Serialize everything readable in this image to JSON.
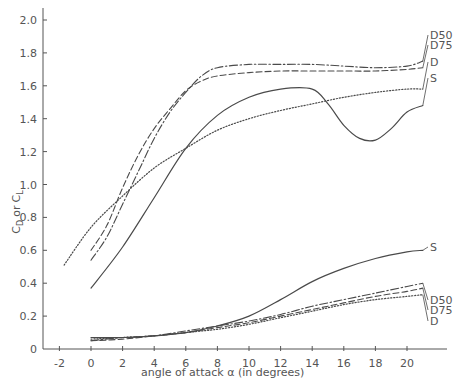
{
  "chart_data": {
    "type": "line",
    "title": "",
    "xlabel": "angle of attack  α (in degrees)",
    "ylabel": "C_D or C_L",
    "xlim": [
      -2.8,
      22.5
    ],
    "ylim": [
      0,
      2.1
    ],
    "grid": false,
    "legend": "inline labels at right end of each curve",
    "x_ticks": [
      -2,
      0,
      2,
      4,
      6,
      8,
      10,
      12,
      14,
      16,
      18,
      20
    ],
    "x_tick_labels": [
      "-2",
      "0",
      "2",
      "4",
      "6",
      "8",
      "10",
      "12",
      "14",
      "16",
      "18",
      "20"
    ],
    "y_ticks": [
      0,
      0.2,
      0.4,
      0.6,
      0.8,
      1.0,
      1.2,
      1.4,
      1.6,
      1.8,
      2.0
    ],
    "y_tick_labels": [
      "0",
      "0.2",
      "0.4",
      "0.6",
      "0.8",
      "1.0",
      "1.2",
      "1.4",
      "1.6",
      "1.8",
      "2.0"
    ],
    "series": [
      {
        "name": "D50",
        "group": "lift",
        "style": "dash-dot",
        "x": [
          0,
          1,
          2,
          3,
          4,
          5,
          6,
          7,
          8,
          10,
          12,
          14,
          16,
          18,
          20,
          21
        ],
        "values": [
          0.54,
          0.68,
          0.88,
          1.08,
          1.28,
          1.44,
          1.56,
          1.66,
          1.71,
          1.73,
          1.73,
          1.73,
          1.72,
          1.71,
          1.72,
          1.75
        ]
      },
      {
        "name": "D75",
        "group": "lift",
        "style": "dashed",
        "x": [
          0,
          1,
          2,
          3,
          4,
          5,
          6,
          7,
          8,
          10,
          12,
          14,
          16,
          18,
          20,
          21
        ],
        "values": [
          0.6,
          0.75,
          0.98,
          1.18,
          1.34,
          1.46,
          1.57,
          1.63,
          1.66,
          1.68,
          1.69,
          1.69,
          1.69,
          1.69,
          1.7,
          1.71
        ]
      },
      {
        "name": "D",
        "group": "lift",
        "style": "dotted",
        "x": [
          -1.7,
          0,
          2,
          4,
          6,
          8,
          10,
          12,
          14,
          16,
          18,
          20,
          21
        ],
        "values": [
          0.51,
          0.74,
          0.93,
          1.1,
          1.22,
          1.33,
          1.4,
          1.45,
          1.49,
          1.53,
          1.56,
          1.58,
          1.58
        ]
      },
      {
        "name": "S",
        "group": "lift",
        "style": "solid",
        "x": [
          0,
          2,
          4,
          6,
          8,
          10,
          12,
          14,
          15,
          16,
          17,
          18,
          19,
          20,
          21
        ],
        "values": [
          0.37,
          0.62,
          0.92,
          1.22,
          1.42,
          1.53,
          1.58,
          1.58,
          1.49,
          1.36,
          1.28,
          1.27,
          1.34,
          1.44,
          1.48
        ]
      },
      {
        "name": "S",
        "group": "drag",
        "style": "solid",
        "x": [
          0,
          2,
          4,
          6,
          8,
          10,
          12,
          14,
          16,
          18,
          20,
          21
        ],
        "values": [
          0.07,
          0.07,
          0.08,
          0.1,
          0.14,
          0.2,
          0.3,
          0.41,
          0.49,
          0.55,
          0.59,
          0.6
        ]
      },
      {
        "name": "D50",
        "group": "drag",
        "style": "dash-dot",
        "x": [
          0,
          2,
          4,
          6,
          8,
          10,
          12,
          14,
          16,
          18,
          20,
          21
        ],
        "values": [
          0.05,
          0.07,
          0.08,
          0.11,
          0.14,
          0.17,
          0.21,
          0.26,
          0.3,
          0.34,
          0.38,
          0.4
        ]
      },
      {
        "name": "D75",
        "group": "drag",
        "style": "dashed",
        "x": [
          0,
          2,
          4,
          6,
          8,
          10,
          12,
          14,
          16,
          18,
          20,
          21
        ],
        "values": [
          0.05,
          0.06,
          0.08,
          0.1,
          0.13,
          0.16,
          0.2,
          0.24,
          0.28,
          0.32,
          0.35,
          0.37
        ]
      },
      {
        "name": "D",
        "group": "drag",
        "style": "dotted",
        "x": [
          0,
          2,
          4,
          6,
          8,
          10,
          12,
          14,
          16,
          18,
          20,
          21
        ],
        "values": [
          0.06,
          0.07,
          0.08,
          0.1,
          0.12,
          0.15,
          0.19,
          0.23,
          0.27,
          0.3,
          0.32,
          0.33
        ]
      }
    ]
  },
  "labels": {
    "ylabel_main": "C",
    "ylabel_sub1": "D",
    "ylabel_or": "or",
    "ylabel_sub2": "L",
    "xlabel": "angle of attack  α (in degrees)"
  },
  "colors": {
    "ink": "#4a4a4a",
    "axis": "#555555",
    "background": "#ffffff"
  }
}
